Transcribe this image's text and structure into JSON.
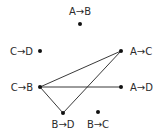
{
  "diagram": {
    "type": "graph",
    "nodes": [
      {
        "id": "AB",
        "label": "A→B",
        "x": 80,
        "y": 24,
        "lx": 80,
        "ly": 15,
        "anchor": "middle"
      },
      {
        "id": "CD",
        "label": "C→D",
        "x": 40,
        "y": 51,
        "lx": 33,
        "ly": 55,
        "anchor": "end"
      },
      {
        "id": "AC",
        "label": "A→C",
        "x": 121,
        "y": 51,
        "lx": 130,
        "ly": 55,
        "anchor": "start"
      },
      {
        "id": "CB",
        "label": "C→B",
        "x": 40,
        "y": 87,
        "lx": 33,
        "ly": 91,
        "anchor": "end"
      },
      {
        "id": "AD",
        "label": "A→D",
        "x": 121,
        "y": 87,
        "lx": 130,
        "ly": 91,
        "anchor": "start"
      },
      {
        "id": "BD",
        "label": "B→D",
        "x": 63,
        "y": 113,
        "lx": 63,
        "ly": 128,
        "anchor": "middle"
      },
      {
        "id": "BC",
        "label": "B→C",
        "x": 98,
        "y": 112,
        "lx": 98,
        "ly": 128,
        "anchor": "middle"
      }
    ],
    "edges": [
      {
        "from": "CB",
        "to": "AC"
      },
      {
        "from": "CB",
        "to": "AD"
      },
      {
        "from": "CB",
        "to": "BD"
      },
      {
        "from": "BD",
        "to": "AC"
      }
    ]
  }
}
